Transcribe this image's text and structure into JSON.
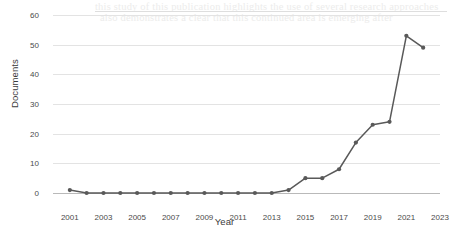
{
  "figure": {
    "background_color": "#ffffff",
    "series_color": "#595959",
    "grid_color": "#e3e3e3",
    "axis_color": "#b9b9b9",
    "tick_text_color": "#4a4a4a",
    "axis_title_color": "#3b3b3b"
  },
  "bleed_through": {
    "line1": "this study of this publication highlights the use of several research approaches",
    "line2": "also demonstrates a clear that this continued area is emerging after"
  },
  "chart_data": {
    "type": "line",
    "title": "",
    "subtitle": "",
    "xlabel": "Year",
    "ylabel": "Documents",
    "grid": true,
    "legend": "none",
    "xlim": [
      2000,
      2023
    ],
    "ylim": [
      0,
      60
    ],
    "xticks": [
      2001,
      2003,
      2005,
      2007,
      2009,
      2011,
      2013,
      2015,
      2017,
      2019,
      2021,
      2023
    ],
    "xtick_labels": [
      "2001",
      "2003",
      "2005",
      "2007",
      "2009",
      "2011",
      "2013",
      "2015",
      "2017",
      "2019",
      "2021",
      "2023"
    ],
    "yticks": [
      0,
      10,
      20,
      30,
      40,
      50,
      60
    ],
    "ytick_labels": [
      "0",
      "10",
      "20",
      "30",
      "40",
      "50",
      "60"
    ],
    "marker": "circle",
    "x": [
      2001,
      2002,
      2003,
      2004,
      2005,
      2006,
      2007,
      2008,
      2009,
      2010,
      2011,
      2012,
      2013,
      2014,
      2015,
      2016,
      2017,
      2018,
      2019,
      2020,
      2021,
      2022
    ],
    "values": [
      1,
      0,
      0,
      0,
      0,
      0,
      0,
      0,
      0,
      0,
      0,
      0,
      0,
      1,
      5,
      5,
      8,
      17,
      23,
      24,
      53,
      49
    ],
    "series": [
      {
        "name": "Documents",
        "color": "#595959",
        "x": [
          2001,
          2002,
          2003,
          2004,
          2005,
          2006,
          2007,
          2008,
          2009,
          2010,
          2011,
          2012,
          2013,
          2014,
          2015,
          2016,
          2017,
          2018,
          2019,
          2020,
          2021,
          2022
        ],
        "values": [
          1,
          0,
          0,
          0,
          0,
          0,
          0,
          0,
          0,
          0,
          0,
          0,
          0,
          1,
          5,
          5,
          8,
          17,
          23,
          24,
          53,
          49
        ]
      }
    ]
  }
}
